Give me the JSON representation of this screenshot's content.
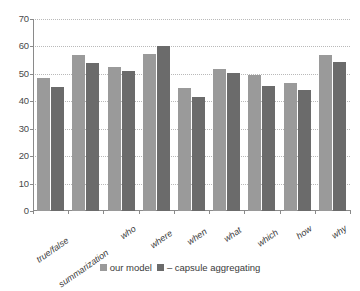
{
  "chart_data": {
    "type": "bar",
    "title": "",
    "xlabel": "",
    "ylabel": "",
    "ylim": [
      0,
      70
    ],
    "yticks": [
      0,
      10,
      20,
      30,
      40,
      50,
      60,
      70
    ],
    "grid": true,
    "legend_position": "bottom",
    "categories": [
      "true/false",
      "summarization",
      "who",
      "where",
      "when",
      "what",
      "which",
      "how",
      "why"
    ],
    "series": [
      {
        "name": "our model",
        "color": "#9a9a9a",
        "values": [
          48.4,
          56.7,
          52.6,
          57.1,
          45.0,
          51.7,
          49.6,
          46.7,
          56.7
        ]
      },
      {
        "name": "– capsule aggregating",
        "color": "#6b6b6b",
        "values": [
          45.2,
          54.0,
          51.0,
          60.0,
          41.7,
          50.4,
          45.5,
          44.0,
          54.2
        ]
      }
    ]
  },
  "axis": {
    "y_tick_labels": [
      "0",
      "10",
      "20",
      "30",
      "40",
      "50",
      "60",
      "70"
    ]
  },
  "legend": {
    "items": [
      {
        "label": "our model"
      },
      {
        "label": "– capsule aggregating"
      }
    ]
  },
  "colors": {
    "series_our_model": "#9a9a9a",
    "series_capsule_aggregating": "#6b6b6b",
    "axis": "#8a8a8a",
    "gridline": "#b9b9b9",
    "background": "#ffffff"
  }
}
